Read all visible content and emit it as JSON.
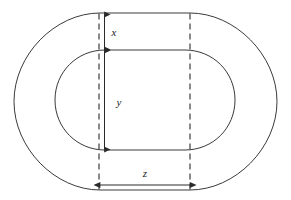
{
  "figure": {
    "background_color": "#ffffff",
    "stroke_color": "#3a3a3a",
    "label_color": "#1a1a1a",
    "width": 291,
    "height": 200,
    "outer_shape": {
      "name": "outer-rounded-rectangle",
      "left": 14,
      "top": 13,
      "right": 277,
      "bottom": 190,
      "corner_radius_x": 86,
      "corner_radius_y": 88
    },
    "inner_shape": {
      "name": "inner-rounded-rectangle",
      "left": 55,
      "top": 50,
      "right": 235,
      "bottom": 150,
      "corner_radius_x": 50,
      "corner_radius_y": 50
    },
    "guide_lines": [
      {
        "name": "left-dashed-guide",
        "x": 99,
        "y_top": 13,
        "y_bottom": 190,
        "style": "dashed"
      },
      {
        "name": "right-dashed-guide",
        "x": 190,
        "y_top": 13,
        "y_bottom": 190,
        "style": "dashed"
      }
    ],
    "dimensions": [
      {
        "id": "x",
        "label": "x",
        "orientation": "vertical",
        "axis_position": 104,
        "from": 14,
        "to": 50,
        "label_x": 114,
        "label_y": 36,
        "description": "wall thickness between outer top edge and inner top edge"
      },
      {
        "id": "y",
        "label": "y",
        "orientation": "vertical",
        "axis_position": 104,
        "from": 50,
        "to": 150,
        "label_x": 119,
        "label_y": 106,
        "description": "inner cavity height"
      },
      {
        "id": "z",
        "label": "z",
        "orientation": "horizontal",
        "axis_position": 185,
        "from": 100,
        "to": 190,
        "label_x": 145,
        "label_y": 177,
        "description": "flat base width between the two dashed guides"
      }
    ]
  }
}
